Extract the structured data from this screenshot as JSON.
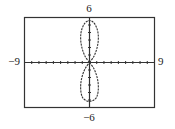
{
  "chart_data": {
    "type": "line",
    "title": "",
    "xlabel": "",
    "ylabel": "",
    "xlim": [
      -9,
      9
    ],
    "ylim": [
      -6,
      6
    ],
    "xscale_ticks": 1,
    "yscale_ticks": 1,
    "grid": false,
    "legend": null,
    "tick_labels": {
      "x_min": "−9",
      "x_max": "9",
      "y_min": "−6",
      "y_max": "6"
    },
    "series": [
      {
        "name": "polar-curve-two-vertical-petals",
        "description": "Figure-eight shaped polar graph with two petals along the y-axis, meeting at the origin",
        "points": [
          [
            0,
            0
          ],
          [
            0.6,
            0.8
          ],
          [
            1.0,
            1.8
          ],
          [
            1.2,
            2.8
          ],
          [
            1.2,
            3.8
          ],
          [
            1.0,
            4.6
          ],
          [
            0.6,
            5.3
          ],
          [
            0,
            5.6
          ],
          [
            -0.6,
            5.3
          ],
          [
            -1.0,
            4.6
          ],
          [
            -1.2,
            3.8
          ],
          [
            -1.2,
            2.8
          ],
          [
            -1.0,
            1.8
          ],
          [
            -0.6,
            0.8
          ],
          [
            0,
            0
          ],
          [
            0.6,
            -0.8
          ],
          [
            1.0,
            -1.8
          ],
          [
            1.2,
            -2.8
          ],
          [
            1.2,
            -3.8
          ],
          [
            1.0,
            -4.6
          ],
          [
            0.6,
            -5.0
          ],
          [
            0,
            -5.2
          ],
          [
            -0.6,
            -5.0
          ],
          [
            -1.0,
            -4.6
          ],
          [
            -1.2,
            -3.8
          ],
          [
            -1.2,
            -2.8
          ],
          [
            -1.0,
            -1.8
          ],
          [
            -0.6,
            -0.8
          ],
          [
            0,
            0
          ]
        ]
      }
    ]
  }
}
